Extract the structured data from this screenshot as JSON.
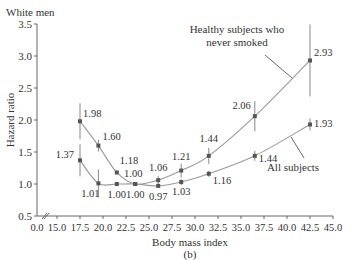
{
  "panel_title": "White men",
  "panel_label": "(b)",
  "chart_data": {
    "type": "line",
    "title": "White men",
    "xlabel": "Body mass index",
    "ylabel": "Hazard ratio",
    "xlim": [
      0.0,
      45.0
    ],
    "ylim": [
      0.5,
      3.5
    ],
    "x_ticks": [
      "0.0",
      "15.0",
      "17.5",
      "20.0",
      "22.5",
      "25.0",
      "27.5",
      "30.0",
      "32.5",
      "35.0",
      "37.5",
      "40.0",
      "42.5",
      "45.0"
    ],
    "y_ticks": [
      "0.5",
      "1.0",
      "1.5",
      "2.0",
      "2.5",
      "3.0",
      "3.5"
    ],
    "axis_break": true,
    "grid": false,
    "series": [
      {
        "name": "Healthy subjects who never smoked",
        "x": [
          17.5,
          19.5,
          21.5,
          23.5,
          26.0,
          28.5,
          31.5,
          36.5,
          42.5
        ],
        "values": [
          1.98,
          1.6,
          1.18,
          1.0,
          1.06,
          1.21,
          1.44,
          2.06,
          2.93
        ],
        "labels": [
          "1.98",
          "1.60",
          "1.18",
          "1.00",
          "1.06",
          "1.21",
          "1.44",
          "2.06",
          "2.93"
        ]
      },
      {
        "name": "All subjects",
        "x": [
          17.5,
          19.5,
          21.5,
          23.5,
          26.0,
          28.5,
          31.5,
          36.5,
          42.5
        ],
        "values": [
          1.37,
          1.01,
          1.0,
          1.0,
          0.97,
          1.03,
          1.16,
          1.44,
          1.93
        ],
        "labels": [
          "1.37",
          "1.01",
          "1.00",
          "1.00",
          "0.97",
          "1.03",
          "1.16",
          "1.44",
          "1.93"
        ]
      }
    ],
    "annotations": [
      "Healthy subjects who never smoked",
      "All subjects"
    ],
    "colors": {
      "line": "#9a9a9a",
      "marker": "#555555",
      "axis": "#666666",
      "text": "#333333"
    }
  }
}
